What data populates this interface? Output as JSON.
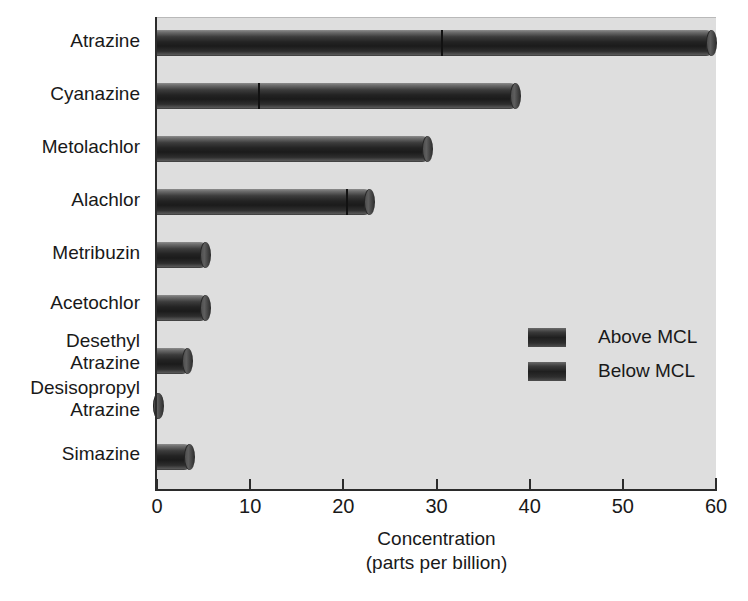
{
  "chart_data": {
    "type": "bar",
    "orientation": "horizontal",
    "stacked": true,
    "title": "",
    "subtitle": "",
    "xlabel_line1": "Concentration",
    "xlabel_line2": "(parts per billion)",
    "ylabel": "",
    "xlim": [
      0,
      60
    ],
    "xticks": [
      0,
      10,
      20,
      30,
      40,
      50,
      60
    ],
    "xtick_labels": [
      "0",
      "10",
      "20",
      "30",
      "40",
      "50",
      "60"
    ],
    "grid": false,
    "legend_position": "center-right",
    "categories": [
      "Atrazine",
      "Cyanazine",
      "Metolachlor",
      "Alachlor",
      "Metribuzin",
      "Acetochlor",
      "Desethyl Atrazine",
      "Desisopropyl Atrazine",
      "Simazine"
    ],
    "category_label_lines": [
      [
        "Atrazine"
      ],
      [
        "Cyanazine"
      ],
      [
        "Metolachlor"
      ],
      [
        "Alachlor"
      ],
      [
        "Metribuzin"
      ],
      [
        "Acetochlor"
      ],
      [
        "Desethyl",
        "Atrazine"
      ],
      [
        "Desisopropyl",
        "Atrazine"
      ],
      [
        "Simazine"
      ]
    ],
    "series": [
      {
        "name": "Above MCL",
        "values": [
          30.5,
          10.8,
          29.5,
          20.3,
          5.7,
          5.7,
          3.8,
          0.6,
          4.0
        ]
      },
      {
        "name": "Below MCL",
        "values": [
          29.5,
          28.2,
          0,
          3.0,
          0,
          0,
          0,
          0,
          0
        ]
      }
    ],
    "totals": [
      60.0,
      39.0,
      29.5,
      23.3,
      5.7,
      5.7,
      3.8,
      0.6,
      4.0
    ],
    "colors": {
      "above_mcl": "#232323",
      "below_mcl": "#232323",
      "plot_background": "#dedede",
      "page_background": "#ffffff",
      "axis": "#2b2b2b",
      "text": "#191919"
    }
  },
  "legend": {
    "entries": [
      {
        "label": "Above MCL",
        "swatch": "legend-swatch-above-mcl"
      },
      {
        "label": "Below MCL",
        "swatch": "legend-swatch-below-mcl"
      }
    ]
  }
}
